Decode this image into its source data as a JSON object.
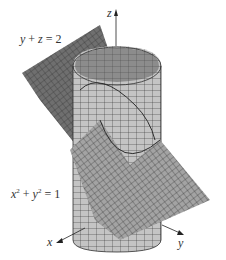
{
  "figure": {
    "plane_equation": {
      "lhs_a": "y",
      "plus": " + ",
      "lhs_b": "z",
      "eq": " = ",
      "rhs": "2"
    },
    "cylinder_equation": {
      "var_a": "x",
      "exp_a": "2",
      "plus": " + ",
      "var_b": "y",
      "exp_b": "2",
      "eq": " = ",
      "rhs": "1"
    },
    "axes": {
      "x": "x",
      "y": "y",
      "z": "z"
    },
    "colors": {
      "plane_dark": "#6f6f6f",
      "plane_light": "#9a9a9a",
      "cylinder_face": "#c4c4c4",
      "cylinder_inner": "#8c8c8c",
      "grid_line": "#2e2e2e",
      "axis": "#222222"
    }
  }
}
